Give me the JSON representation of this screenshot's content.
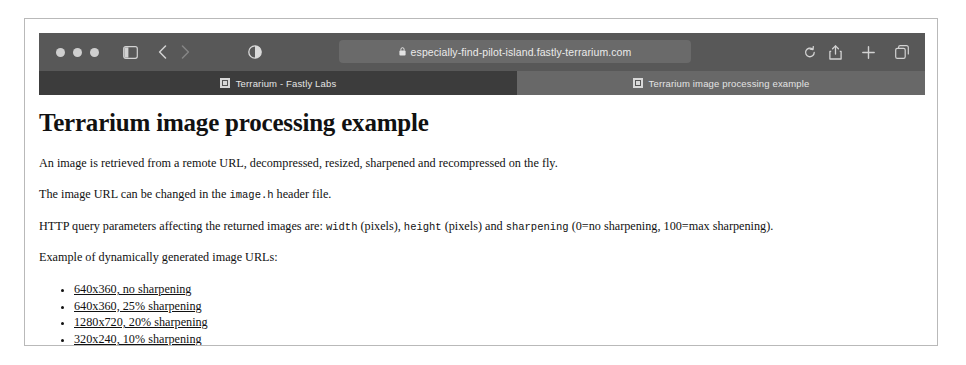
{
  "browser": {
    "window_controls": [
      "close",
      "minimize",
      "maximize"
    ],
    "icons": {
      "sidebar": "sidebar-icon",
      "back": "back-chevron-icon",
      "forward": "forward-chevron-icon",
      "reader": "reader-contrast-icon",
      "lock": "lock-icon",
      "reload": "reload-icon",
      "share": "share-icon",
      "new_tab": "plus-icon",
      "tab_overview": "tab-overview-icon"
    },
    "address_bar": {
      "url": "especially-find-pilot-island.fastly-terrarium.com",
      "secure": true
    },
    "tabs": [
      {
        "title": "Terrarium - Fastly Labs",
        "active": false
      },
      {
        "title": "Terrarium image processing example",
        "active": true
      }
    ]
  },
  "page": {
    "title": "Terrarium image processing example",
    "paragraphs": {
      "p1": "An image is retrieved from a remote URL, decompressed, resized, sharpened and recompressed on the fly.",
      "p2_before": "The image URL can be changed in the ",
      "p2_code": "image.h",
      "p2_after": " header file.",
      "p3_before": "HTTP query parameters affecting the returned images are: ",
      "p3_code1": "width",
      "p3_mid1": " (pixels), ",
      "p3_code2": "height",
      "p3_mid2": " (pixels) and ",
      "p3_code3": "sharpening",
      "p3_after": " (0=no sharpening, 100=max sharpening).",
      "p4": "Example of dynamically generated image URLs:"
    },
    "links": [
      "640x360, no sharpening",
      "640x360, 25% sharpening",
      "1280x720, 20% sharpening",
      "320x240, 10% sharpening"
    ]
  },
  "colors": {
    "chrome_bg": "#565656",
    "toolbar_bg": "#585858",
    "tab_strip_bg": "#686868",
    "tab_inactive_bg": "#3c3c3c",
    "url_bar_bg": "#6a6a6a",
    "page_bg": "#ffffff",
    "text": "#111111",
    "frame_border": "#b9b9b9"
  }
}
